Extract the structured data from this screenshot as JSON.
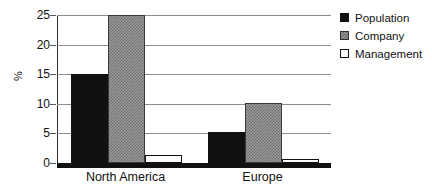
{
  "chart_data": {
    "type": "bar",
    "title": "",
    "subtitle": "",
    "xlabel": "",
    "ylabel": "%",
    "categories": [
      "North America",
      "Europe"
    ],
    "series": [
      {
        "name": "Population",
        "values": [
          15.0,
          5.3
        ],
        "color": "#111111",
        "fill": "solid-black"
      },
      {
        "name": "Company",
        "values": [
          25.0,
          10.1
        ],
        "color": "#9a9a9a",
        "fill": "checkered-gray"
      },
      {
        "name": "Management",
        "values": [
          1.3,
          0.7
        ],
        "color": "#ffffff",
        "fill": "white-outline"
      }
    ],
    "ylim": [
      0,
      25
    ],
    "yticks": [
      0,
      5,
      10,
      15,
      20,
      25
    ],
    "ytick_labels": [
      "0",
      "5",
      "10",
      "15",
      "20",
      "25"
    ],
    "grid": "horizontal",
    "grid_color": "#8d8d8d",
    "legend_position": "top-right",
    "background": "#ffffff",
    "axis_color": "#111111"
  },
  "legend": {
    "items": [
      {
        "label": "Population"
      },
      {
        "label": "Company"
      },
      {
        "label": "Management"
      }
    ]
  }
}
